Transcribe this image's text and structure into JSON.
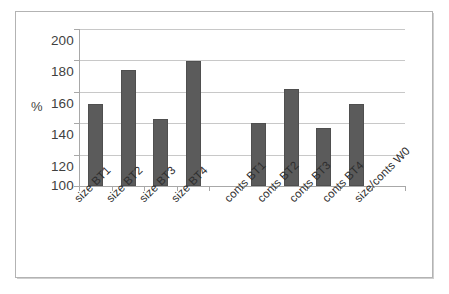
{
  "chart_data": {
    "type": "bar",
    "title": "",
    "subtitle": "",
    "xlabel": "",
    "ylabel": "%",
    "ylim": [
      100,
      200
    ],
    "ytick_labels": [
      "200",
      "180",
      "160",
      "140",
      "120",
      "100"
    ],
    "yticks": [
      200,
      180,
      160,
      140,
      120,
      100
    ],
    "grid": true,
    "legend": "none",
    "bar_color": "#5b5b5b",
    "categories": [
      "size BT1",
      "size BT2",
      "size BT3",
      "size BT4",
      "",
      "conts BT1",
      "conts BT2",
      "conts BT3",
      "conts BT4",
      "size/conts W0"
    ],
    "values": [
      152,
      174,
      142.5,
      179.5,
      null,
      140,
      162,
      137,
      152,
      null
    ],
    "series": [
      {
        "name": "",
        "values": [
          152,
          174,
          142.5,
          179.5,
          null,
          140,
          162,
          137,
          152,
          null
        ]
      }
    ]
  },
  "axis": {
    "y_title": "%",
    "tick_labels": [
      "200",
      "180",
      "160",
      "140",
      "120",
      "100"
    ],
    "category_labels": [
      "size BT1",
      "size BT2",
      "size BT3",
      "size BT4",
      "conts BT1",
      "conts BT2",
      "conts BT3",
      "conts BT4",
      "size/conts W0"
    ]
  }
}
